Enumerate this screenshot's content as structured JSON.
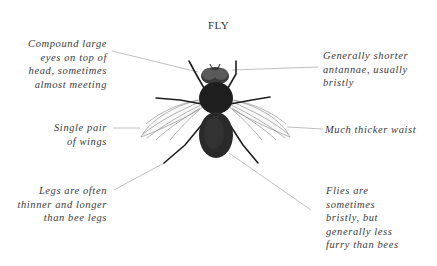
{
  "diagram": {
    "title": "FLY",
    "colors": {
      "background": "#ffffff",
      "text": "#3a3a3a",
      "leader_line": "#b0b0b0",
      "fly_body": "#1e1e1e"
    },
    "annotations": [
      {
        "id": "eyes",
        "side": "left",
        "lines": [
          "Compound large",
          "eyes on top of",
          "head, sometimes",
          "almost meeting"
        ]
      },
      {
        "id": "wings",
        "side": "left",
        "lines": [
          "Single pair",
          "of wings"
        ]
      },
      {
        "id": "legs",
        "side": "left",
        "lines": [
          "Legs are often",
          "thinner and longer",
          "than bee legs"
        ]
      },
      {
        "id": "antennae",
        "side": "right",
        "lines": [
          "Generally shorter",
          "antannae, usually",
          "bristly"
        ]
      },
      {
        "id": "waist",
        "side": "right",
        "lines": [
          "Much thicker waist"
        ]
      },
      {
        "id": "fur",
        "side": "right",
        "lines": [
          "Flies are",
          "sometimes",
          "bristly, but",
          "generally less",
          "furry than bees"
        ]
      }
    ]
  }
}
